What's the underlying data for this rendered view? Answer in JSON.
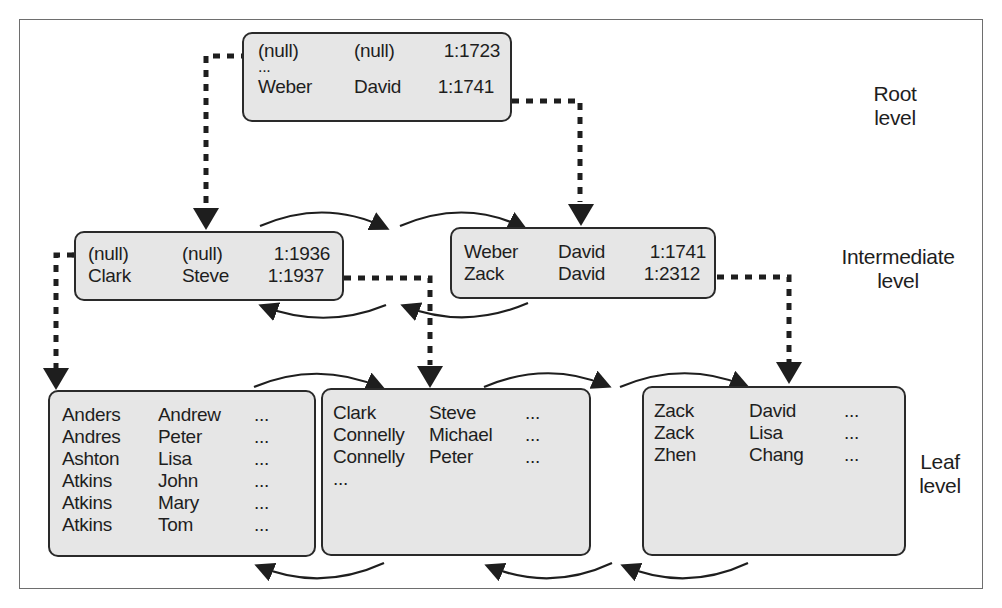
{
  "diagram": {
    "type": "b-tree-index",
    "level_labels": {
      "root": [
        "Root",
        "level"
      ],
      "intermediate": [
        "Intermediate",
        "level"
      ],
      "leaf": [
        "Leaf",
        "level"
      ]
    },
    "root_node": {
      "rows": [
        {
          "last": "(null)",
          "first": "(null)",
          "pointer": "1:1723"
        },
        {
          "ellipsis": "..."
        },
        {
          "last": "Weber",
          "first": "David",
          "pointer": "1:1741"
        }
      ]
    },
    "intermediate_nodes": [
      {
        "rows": [
          {
            "last": "(null)",
            "first": "(null)",
            "pointer": "1:1936"
          },
          {
            "last": "Clark",
            "first": "Steve",
            "pointer": "1:1937"
          }
        ]
      },
      {
        "rows": [
          {
            "last": "Weber",
            "first": "David",
            "pointer": "1:1741"
          },
          {
            "last": "Zack",
            "first": "David",
            "pointer": "1:2312"
          }
        ]
      }
    ],
    "leaf_nodes": [
      {
        "rows": [
          {
            "last": "Anders",
            "first": "Andrew",
            "rest": "..."
          },
          {
            "last": "Andres",
            "first": "Peter",
            "rest": "..."
          },
          {
            "last": "Ashton",
            "first": "Lisa",
            "rest": "..."
          },
          {
            "last": "Atkins",
            "first": "John",
            "rest": "..."
          },
          {
            "last": "Atkins",
            "first": "Mary",
            "rest": "..."
          },
          {
            "last": "Atkins",
            "first": "Tom",
            "rest": "..."
          }
        ]
      },
      {
        "rows": [
          {
            "last": "Clark",
            "first": "Steve",
            "rest": "..."
          },
          {
            "last": "Connelly",
            "first": "Michael",
            "rest": "..."
          },
          {
            "last": "Connelly",
            "first": "Peter",
            "rest": "..."
          },
          {
            "last": "...",
            "first": "",
            "rest": ""
          }
        ]
      },
      {
        "rows": [
          {
            "last": "Zack",
            "first": "David",
            "rest": "..."
          },
          {
            "last": "Zack",
            "first": "Lisa",
            "rest": "..."
          },
          {
            "last": "Zhen",
            "first": "Chang",
            "rest": "..."
          }
        ]
      }
    ],
    "colors": {
      "node_fill": "#e6e6e6",
      "node_border": "#2a2a2a",
      "connector": "#1e1e1e",
      "frame_border": "#6e6e6e",
      "background": "#ffffff"
    }
  }
}
